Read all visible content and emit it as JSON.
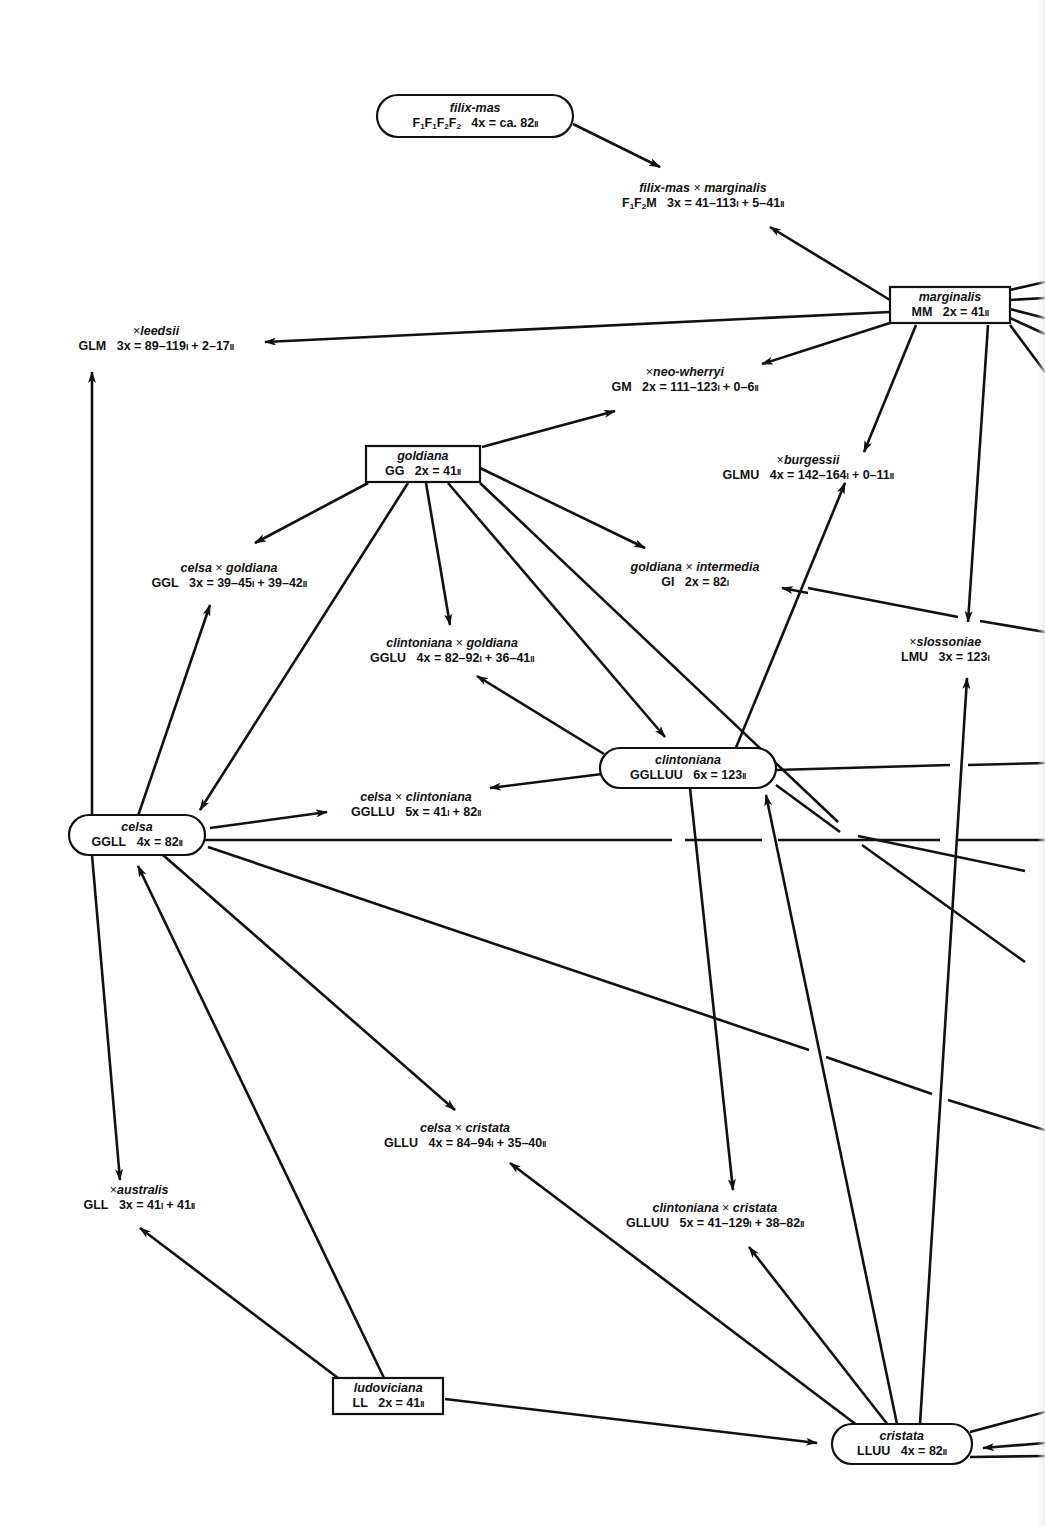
{
  "figure": {
    "type": "hybridization-network",
    "stroke_color": "#111111",
    "background": "#ffffff"
  },
  "taxa": [
    {
      "id": "filix-mas",
      "kind": "species",
      "shape": "pill",
      "name": "filix-mas",
      "genome_html": "F<sub>1</sub>F<sub>1</sub>F<sub>2</sub>F<sub>2</sub>",
      "ploidy": "4x",
      "count": "ca. 82",
      "pairing": "II",
      "x": 475,
      "y": 116,
      "w": 196,
      "h": 42
    },
    {
      "id": "filix-mas-x-marginalis",
      "kind": "hybrid",
      "name": "filix-mas × marginalis",
      "genome_html": "F<sub>1</sub>F<sub>2</sub>M",
      "ploidy": "3x",
      "count": "41–113I + 5–41II",
      "x": 703,
      "y": 196
    },
    {
      "id": "marginalis",
      "kind": "species",
      "shape": "rect",
      "name": "marginalis",
      "genome_html": "MM",
      "ploidy": "2x",
      "count": "41",
      "pairing": "II",
      "x": 950,
      "y": 305,
      "w": 120,
      "h": 36
    },
    {
      "id": "leedsii",
      "kind": "hybrid",
      "name": "× leedsii",
      "genome_html": "GLM",
      "ploidy": "3x",
      "count": "89–119I + 2–17II",
      "x": 156,
      "y": 339
    },
    {
      "id": "neo-wherryi",
      "kind": "hybrid",
      "name": "× neo-wherryi",
      "genome_html": "GM",
      "ploidy": "2x",
      "count": "111–123I + 0–6II",
      "x": 685,
      "y": 380
    },
    {
      "id": "goldiana",
      "kind": "species",
      "shape": "rect",
      "name": "goldiana",
      "genome_html": "GG",
      "ploidy": "2x",
      "count": "41",
      "pairing": "II",
      "x": 423,
      "y": 464,
      "w": 114,
      "h": 36
    },
    {
      "id": "burgessii",
      "kind": "hybrid",
      "name": "× burgessii",
      "genome_html": "GLMU",
      "ploidy": "4x",
      "count": "142–164I + 0–11II",
      "x": 808,
      "y": 468
    },
    {
      "id": "celsa-x-goldiana",
      "kind": "hybrid",
      "name": "celsa × goldiana",
      "genome_html": "GGL",
      "ploidy": "3x",
      "count": "39–45I + 39–42II",
      "x": 229,
      "y": 576
    },
    {
      "id": "goldiana-x-intermedia",
      "kind": "hybrid",
      "name": "goldiana × intermedia",
      "genome_html": "GI",
      "ploidy": "2x",
      "count": "82I",
      "x": 695,
      "y": 575
    },
    {
      "id": "clintoniana-x-goldiana",
      "kind": "hybrid",
      "name": "clintoniana × goldiana",
      "genome_html": "GGLU",
      "ploidy": "4x",
      "count": "82–92I + 36–41II",
      "x": 452,
      "y": 651
    },
    {
      "id": "slossoniae",
      "kind": "hybrid",
      "name": "× slossoniae",
      "genome_html": "LMU",
      "ploidy": "3x",
      "count": "123I",
      "x": 945,
      "y": 650
    },
    {
      "id": "clintoniana",
      "kind": "species",
      "shape": "pill",
      "name": "clintoniana",
      "genome_html": "GGLLUU",
      "ploidy": "6x",
      "count": "123",
      "pairing": "II",
      "x": 688,
      "y": 768,
      "w": 176,
      "h": 40
    },
    {
      "id": "celsa-x-clintoniana",
      "kind": "hybrid",
      "name": "celsa × clintoniana",
      "genome_html": "GGLLU",
      "ploidy": "5x",
      "count": "41I + 82II",
      "x": 416,
      "y": 805
    },
    {
      "id": "celsa",
      "kind": "species",
      "shape": "pill",
      "name": "celsa",
      "genome_html": "GGLL",
      "ploidy": "4x",
      "count": "82",
      "pairing": "II",
      "x": 137,
      "y": 835,
      "w": 136,
      "h": 40
    },
    {
      "id": "celsa-x-cristata",
      "kind": "hybrid",
      "name": "celsa × cristata",
      "genome_html": "GLLU",
      "ploidy": "4x",
      "count": "84–94I + 35–40II",
      "x": 465,
      "y": 1136
    },
    {
      "id": "australis",
      "kind": "hybrid",
      "name": "× australis",
      "genome_html": "GLL",
      "ploidy": "3x",
      "count": "41I + 41II",
      "x": 139,
      "y": 1198
    },
    {
      "id": "clintoniana-x-cristata",
      "kind": "hybrid",
      "name": "clintoniana × cristata",
      "genome_html": "GLLUU",
      "ploidy": "5x",
      "count": "41–129I + 38–82II",
      "x": 715,
      "y": 1216
    },
    {
      "id": "ludoviciana",
      "kind": "species",
      "shape": "rect",
      "name": "ludoviciana",
      "genome_html": "LL",
      "ploidy": "2x",
      "count": "41",
      "pairing": "II",
      "x": 388,
      "y": 1396,
      "w": 110,
      "h": 36
    },
    {
      "id": "cristata",
      "kind": "species",
      "shape": "pill",
      "name": "cristata",
      "genome_html": "LLUU",
      "ploidy": "4x",
      "count": "82",
      "pairing": "II",
      "x": 902,
      "y": 1444,
      "w": 140,
      "h": 40
    }
  ],
  "edges": [
    {
      "from": [
        573,
        124
      ],
      "to": [
        660,
        167
      ],
      "arrow": true
    },
    {
      "from": [
        890,
        300
      ],
      "to": [
        770,
        227
      ],
      "arrow": true
    },
    {
      "from": [
        890,
        312
      ],
      "to": [
        265,
        342
      ],
      "arrow": true
    },
    {
      "from": [
        893,
        322
      ],
      "to": [
        762,
        364
      ],
      "arrow": true
    },
    {
      "from": [
        916,
        325
      ],
      "to": [
        864,
        452
      ],
      "arrow": true
    },
    {
      "from": [
        988,
        325
      ],
      "to": [
        968,
        622
      ],
      "arrow": true
    },
    {
      "from": [
        1010,
        290
      ],
      "to": [
        1045,
        282
      ],
      "arrow": false
    },
    {
      "from": [
        1010,
        300
      ],
      "to": [
        1045,
        298
      ],
      "arrow": false
    },
    {
      "from": [
        1010,
        309
      ],
      "to": [
        1045,
        318
      ],
      "arrow": false
    },
    {
      "from": [
        1010,
        318
      ],
      "to": [
        1045,
        334
      ],
      "arrow": false
    },
    {
      "from": [
        1010,
        325
      ],
      "to": [
        1045,
        372
      ],
      "arrow": false
    },
    {
      "from": [
        482,
        447
      ],
      "to": [
        615,
        411
      ],
      "arrow": true
    },
    {
      "from": [
        368,
        483
      ],
      "to": [
        255,
        543
      ],
      "arrow": true
    },
    {
      "from": [
        426,
        483
      ],
      "to": [
        450,
        625
      ],
      "arrow": true
    },
    {
      "from": [
        408,
        483
      ],
      "to": [
        200,
        810
      ],
      "arrow": true
    },
    {
      "from": [
        448,
        483
      ],
      "to": [
        665,
        737
      ],
      "arrow": true
    },
    {
      "from": [
        480,
        468
      ],
      "to": [
        645,
        548
      ],
      "arrow": true
    },
    {
      "from": [
        480,
        483
      ],
      "to": [
        1045,
        888
      ],
      "arrow": false,
      "gaps": [
        [
          838,
          822
        ],
        [
          858,
          836
        ],
        [
          1025,
          871
        ],
        [
          1045,
          888
        ]
      ]
    },
    {
      "from": [
        808,
        588
      ],
      "to": [
        1045,
        632
      ],
      "arrow": false,
      "gaps": [
        [
          958,
          617
        ],
        [
          980,
          621
        ]
      ]
    },
    {
      "from": [
        808,
        593
      ],
      "to": [
        782,
        588
      ],
      "arrow": true,
      "short": true
    },
    {
      "from": [
        604,
        754
      ],
      "to": [
        477,
        676
      ],
      "arrow": true
    },
    {
      "from": [
        735,
        750
      ],
      "to": [
        845,
        483
      ],
      "arrow": true
    },
    {
      "from": [
        602,
        774
      ],
      "to": [
        490,
        788
      ],
      "arrow": true
    },
    {
      "from": [
        776,
        770
      ],
      "to": [
        1045,
        763
      ],
      "arrow": false,
      "gaps": [
        [
          950,
          765
        ],
        [
          968,
          765
        ]
      ]
    },
    {
      "from": [
        776,
        785
      ],
      "to": [
        1045,
        975
      ],
      "arrow": false,
      "gaps": [
        [
          840,
          832
        ],
        [
          862,
          845
        ],
        [
          1025,
          962
        ],
        [
          1045,
          975
        ]
      ]
    },
    {
      "from": [
        690,
        788
      ],
      "to": [
        733,
        1190
      ],
      "arrow": true
    },
    {
      "from": [
        92,
        816
      ],
      "to": [
        92,
        372
      ],
      "arrow": true
    },
    {
      "from": [
        138,
        816
      ],
      "to": [
        210,
        605
      ],
      "arrow": true
    },
    {
      "from": [
        210,
        828
      ],
      "to": [
        327,
        812
      ],
      "arrow": true
    },
    {
      "from": [
        205,
        840
      ],
      "to": [
        1045,
        840
      ],
      "arrow": false,
      "gaps": [
        [
          672,
          840
        ],
        [
          685,
          840
        ],
        [
          762,
          840
        ],
        [
          778,
          840
        ],
        [
          940,
          840
        ],
        [
          958,
          840
        ]
      ]
    },
    {
      "from": [
        208,
        847
      ],
      "to": [
        1045,
        1130
      ],
      "arrow": false,
      "gaps": [
        [
          809,
          1050
        ],
        [
          826,
          1057
        ],
        [
          932,
          1094
        ],
        [
          948,
          1100
        ]
      ]
    },
    {
      "from": [
        163,
        855
      ],
      "to": [
        455,
        1110
      ],
      "arrow": true
    },
    {
      "from": [
        92,
        855
      ],
      "to": [
        120,
        1180
      ],
      "arrow": true
    },
    {
      "from": [
        384,
        1378
      ],
      "to": [
        138,
        866
      ],
      "arrow": true
    },
    {
      "from": [
        338,
        1378
      ],
      "to": [
        140,
        1228
      ],
      "arrow": true
    },
    {
      "from": [
        445,
        1399
      ],
      "to": [
        817,
        1443
      ],
      "arrow": true
    },
    {
      "from": [
        866,
        1432
      ],
      "to": [
        510,
        1163
      ],
      "arrow": true
    },
    {
      "from": [
        880,
        1427
      ],
      "to": [
        765,
        1455
      ],
      "arrow": false,
      "hidden": true
    },
    {
      "from": [
        888,
        1425
      ],
      "to": [
        749,
        1247
      ],
      "arrow": true
    },
    {
      "from": [
        897,
        1424
      ],
      "to": [
        766,
        795
      ],
      "arrow": true
    },
    {
      "from": [
        920,
        1424
      ],
      "to": [
        967,
        678
      ],
      "arrow": true
    },
    {
      "from": [
        970,
        1432
      ],
      "to": [
        1045,
        1412
      ],
      "arrow": false
    },
    {
      "from": [
        1045,
        1443
      ],
      "to": [
        983,
        1448
      ],
      "arrow": true
    },
    {
      "from": [
        970,
        1457
      ],
      "to": [
        1045,
        1456
      ],
      "arrow": false
    }
  ]
}
